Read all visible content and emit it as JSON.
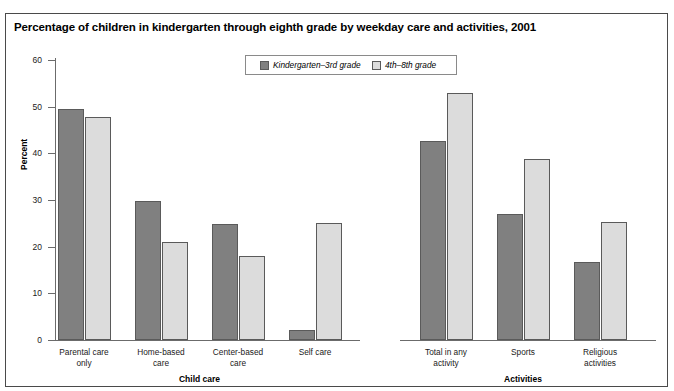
{
  "page": {
    "top_cut_text": "Indicator"
  },
  "chart_panel": {
    "title": "Percentage of children in kindergarten through eighth grade by weekday care and activities, 2001"
  },
  "chart_data": {
    "type": "bar",
    "title": "Percentage of children in kindergarten through eighth grade by weekday care and activities, 2001",
    "xlabel": "",
    "ylabel": "Percent",
    "ylim": [
      0,
      60
    ],
    "yticks": [
      "0",
      "10",
      "20",
      "30",
      "40",
      "50",
      "60"
    ],
    "grid": false,
    "legend_position": "top-center",
    "categories": [
      "Parental care\nonly",
      "Home-based\ncare",
      "Center-based\ncare",
      "Self care",
      "Total in any\nactivity",
      "Sports",
      "Religious\nactivities"
    ],
    "sections": [
      {
        "label": "Child care",
        "categories": [
          "Parental care only",
          "Home-based care",
          "Center-based care",
          "Self care"
        ]
      },
      {
        "label": "Activities",
        "categories": [
          "Total in any activity",
          "Sports",
          "Religious activities"
        ]
      }
    ],
    "series": [
      {
        "name": "Kindergarten–3rd grade",
        "color": "#808080",
        "values": [
          49.5,
          29.8,
          24.8,
          2.2,
          42.6,
          27.1,
          16.7
        ]
      },
      {
        "name": "4th–8th grade",
        "color": "#dcdcdc",
        "values": [
          47.7,
          20.9,
          18.1,
          25.0,
          52.9,
          38.7,
          25.2
        ]
      }
    ]
  }
}
